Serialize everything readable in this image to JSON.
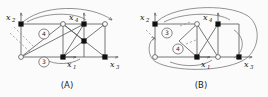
{
  "figure": {
    "background": "#fbfbfb",
    "line_color": "#555555",
    "node_fill_color": "#111111",
    "node_open_color": "#ffffff",
    "panels": [
      {
        "id": "A",
        "caption": "(A)",
        "vertex_labels": [
          {
            "name": "x2",
            "base": "x",
            "sub": "2",
            "position": "top-left"
          },
          {
            "name": "x4",
            "base": "x",
            "sub": "4",
            "position": "top-middle"
          },
          {
            "name": "x1",
            "base": "x",
            "sub": "1",
            "position": "bottom-middle"
          },
          {
            "name": "x3",
            "base": "x",
            "sub": "3",
            "position": "bottom-right"
          }
        ],
        "circled_labels": [
          {
            "text": "4",
            "position": "upper-left-cell"
          },
          {
            "text": "3",
            "position": "bottom-left-edge"
          }
        ],
        "filled_nodes": [
          "top-left",
          "top-middle",
          "bottom-middle",
          "bottom-right"
        ],
        "open_nodes": [
          "bottom-left",
          "top-right"
        ]
      },
      {
        "id": "B",
        "caption": "(B)",
        "vertex_labels": [
          {
            "name": "x2",
            "base": "x",
            "sub": "2",
            "position": "top-left"
          },
          {
            "name": "x4",
            "base": "x",
            "sub": "4",
            "position": "top-middle"
          },
          {
            "name": "x1",
            "base": "x",
            "sub": "1",
            "position": "bottom-middle"
          },
          {
            "name": "x3",
            "base": "x",
            "sub": "3",
            "position": "bottom-right"
          }
        ],
        "circled_labels": [
          {
            "text": "3",
            "position": "left-cell-upper"
          },
          {
            "text": "4",
            "position": "left-cell-lower"
          }
        ],
        "filled_nodes": [
          "top-left",
          "top-middle",
          "bottom-middle",
          "bottom-right"
        ],
        "open_nodes": [
          "bottom-left",
          "top-right"
        ]
      }
    ]
  }
}
